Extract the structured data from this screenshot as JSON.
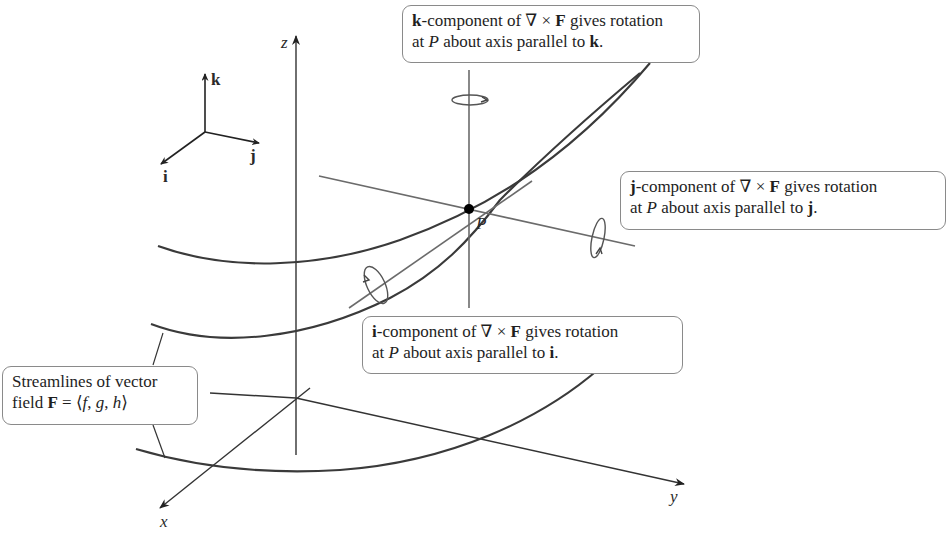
{
  "figure": {
    "point_label": "P",
    "axes": {
      "x": "x",
      "y": "y",
      "z": "z"
    },
    "unit_vectors": {
      "i": "i",
      "j": "j",
      "k": "k"
    },
    "colors": {
      "streamline": "#3a3a3a",
      "axis": "#333333",
      "rotation_axis": "#6b6b6b",
      "callout_border": "#8a8a8a",
      "point": "#000000"
    }
  },
  "callouts": {
    "k": {
      "bold": "k",
      "line1_rest": "-component of ∇ × ",
      "F": "F",
      "line1_end": " gives rotation",
      "line2_pre": "at ",
      "P": "P",
      "line2_mid": " about axis parallel to ",
      "axis": "k",
      "line2_end": "."
    },
    "j": {
      "bold": "j",
      "line1_rest": "-component of ∇ × ",
      "F": "F",
      "line1_end": " gives rotation",
      "line2_pre": "at ",
      "P": "P",
      "line2_mid": " about axis parallel to ",
      "axis": "j",
      "line2_end": "."
    },
    "i": {
      "bold": "i",
      "line1_rest": "-component of ∇ × ",
      "F": "F",
      "line1_end": " gives rotation",
      "line2_pre": "at ",
      "P": "P",
      "line2_mid": " about axis parallel to ",
      "axis": "i",
      "line2_end": "."
    },
    "streamlines": {
      "line1": "Streamlines of vector",
      "line2_pre": "field ",
      "F": "F",
      "line2_mid": " = ⟨",
      "f": "f",
      "c1": ", ",
      "g": "g",
      "c2": ", ",
      "h": "h",
      "line2_end": "⟩"
    }
  }
}
